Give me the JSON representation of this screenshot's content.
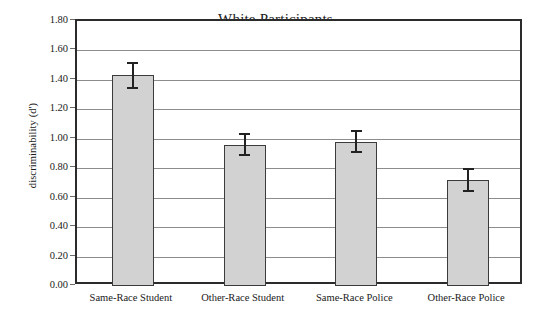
{
  "chart_data": {
    "type": "bar",
    "title": "White Participants",
    "xlabel": "",
    "ylabel": "discriminability (d')",
    "categories": [
      "Same-Race Student",
      "Other-Race Student",
      "Same-Race Police",
      "Other-Race Police"
    ],
    "values": [
      1.43,
      0.96,
      0.98,
      0.72
    ],
    "errors": [
      0.09,
      0.08,
      0.08,
      0.08
    ],
    "error_upper": [
      1.52,
      1.04,
      1.06,
      0.8
    ],
    "error_lower": [
      1.34,
      0.88,
      0.9,
      0.64
    ],
    "ylim": [
      0.0,
      1.8
    ],
    "ytick_step": 0.2,
    "ytick_labels": [
      "0.00",
      "0.20",
      "0.40",
      "0.60",
      "0.80",
      "1.00",
      "1.20",
      "1.40",
      "1.60",
      "1.80"
    ],
    "ytick_values": [
      0.0,
      0.2,
      0.4,
      0.6,
      0.8,
      1.0,
      1.2,
      1.4,
      1.6,
      1.8
    ],
    "grid": true,
    "grid_axis": "y",
    "legend": false,
    "bar_fill_color": "#d2d2d2",
    "bar_edge_color": "#3b3b3b",
    "error_color": "#222222",
    "grid_color": "#8d8d8d",
    "frame_color": "#2b2b2b",
    "background_color": "#ffffff"
  }
}
